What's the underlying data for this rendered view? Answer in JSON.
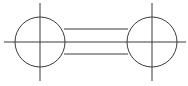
{
  "diagram": {
    "type": "mechanical-symbol",
    "stroke_color": "#3a3a3a",
    "background": "#ffffff",
    "circles": [
      {
        "name": "left-circle",
        "cx": 40,
        "cy": 42,
        "r": 25
      },
      {
        "name": "right-circle",
        "cx": 152,
        "cy": 42,
        "r": 25
      }
    ],
    "center_axis": {
      "x1": 4,
      "y1": 42,
      "x2": 186,
      "y2": 42
    },
    "vertical_axes": [
      {
        "name": "left-vertical-axis",
        "x": 40,
        "y1": 3,
        "y2": 81
      },
      {
        "name": "right-vertical-axis",
        "x": 152,
        "y1": 3,
        "y2": 81
      }
    ],
    "connecting_lines": [
      {
        "name": "top-connector",
        "y": 29,
        "x1": 64,
        "x2": 128
      },
      {
        "name": "bottom-connector",
        "y": 54,
        "x1": 64,
        "x2": 128
      }
    ]
  }
}
